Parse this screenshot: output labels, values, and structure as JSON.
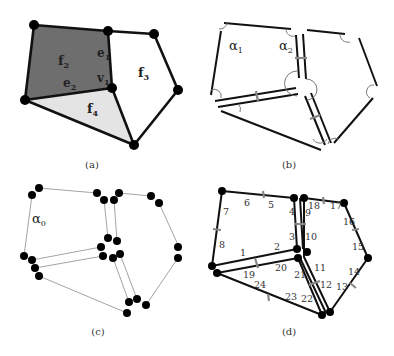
{
  "figure": {
    "panels": [
      {
        "id": "a",
        "caption": "(a)",
        "labels": {
          "f2": "f",
          "f2_sub": "2",
          "f3": "f",
          "f3_sub": "3",
          "f4": "f",
          "f4_sub": "4",
          "e1": "e",
          "e1_sub": "1",
          "e2": "e",
          "e2_sub": "2",
          "v1": "v",
          "v1_sub": "1"
        },
        "colors": {
          "f2_fill": "#6e6e6e",
          "f4_fill": "#e4e4e4",
          "f3_fill": "#ffffff"
        }
      },
      {
        "id": "b",
        "caption": "(b)",
        "labels": {
          "alpha1": "α",
          "alpha1_sub": "1",
          "alpha2": "α",
          "alpha2_sub": "2"
        }
      },
      {
        "id": "c",
        "caption": "(c)",
        "labels": {
          "alpha0": "α",
          "alpha0_sub": "0"
        }
      },
      {
        "id": "d",
        "caption": "(d)",
        "dart_numbers": [
          "1",
          "2",
          "3",
          "4",
          "5",
          "6",
          "7",
          "8",
          "9",
          "10",
          "11",
          "12",
          "13",
          "14",
          "15",
          "16",
          "17",
          "18",
          "19",
          "20",
          "21",
          "22",
          "23",
          "24"
        ]
      }
    ]
  }
}
